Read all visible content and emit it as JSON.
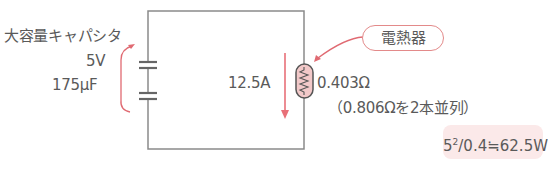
{
  "diagram": {
    "type": "circuit",
    "capacitor": {
      "label": "大容量キャパシタ",
      "voltage": "5V",
      "capacitance": "175μF"
    },
    "current": {
      "value": "12.5A",
      "direction": "down"
    },
    "heater": {
      "callout": "電熱器",
      "resistance": "0.403Ω",
      "note": "（0.806Ωを2本並列）"
    },
    "formula": {
      "base": "5",
      "exponent": "2",
      "rest": "/0.4≒62.5W"
    },
    "colors": {
      "wire": "#8a8a8a",
      "accent": "#e06a72",
      "resistor_fill": "#f2c9c9",
      "formula_bg": "#fbe9e9",
      "text": "#5a5a5a"
    }
  }
}
